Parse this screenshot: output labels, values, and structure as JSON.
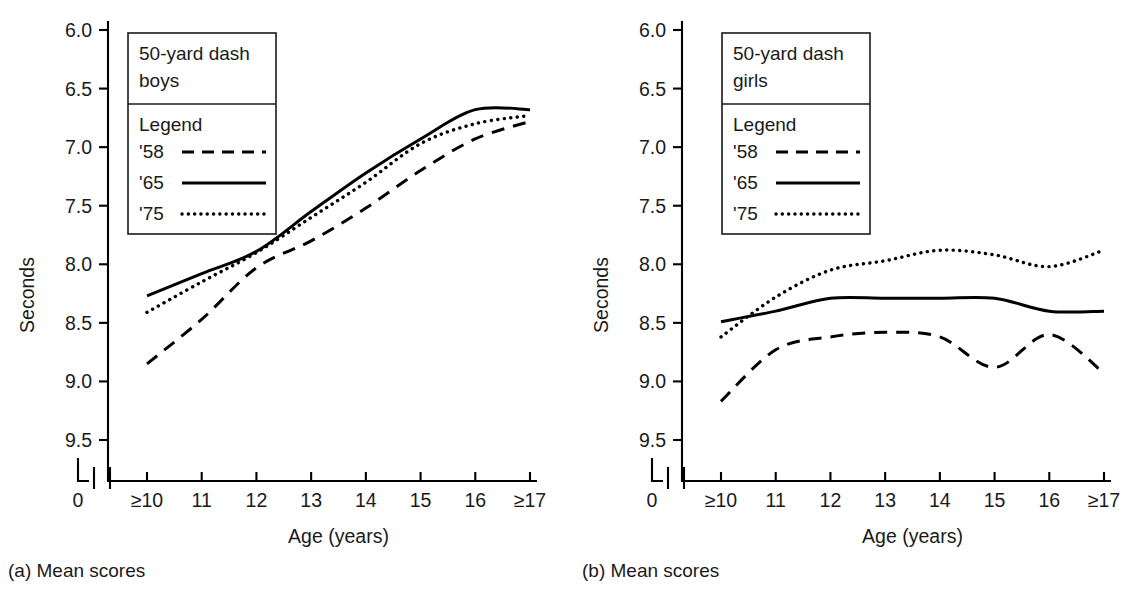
{
  "figure": {
    "panels": [
      {
        "id": "a",
        "caption": "(a) Mean scores",
        "legend": {
          "title_line1": "50-yard dash",
          "title_line2": "boys",
          "heading": "Legend",
          "entries": [
            {
              "label": "'58",
              "style": "dashed"
            },
            {
              "label": "'65",
              "style": "solid"
            },
            {
              "label": "'75",
              "style": "dotted"
            }
          ]
        }
      },
      {
        "id": "b",
        "caption": "(b) Mean scores",
        "legend": {
          "title_line1": "50-yard dash",
          "title_line2": "girls",
          "heading": "Legend",
          "entries": [
            {
              "label": "'58",
              "style": "dashed"
            },
            {
              "label": "'65",
              "style": "solid"
            },
            {
              "label": "'75",
              "style": "dotted"
            }
          ]
        }
      }
    ],
    "origin_label": "0"
  },
  "chart_data": [
    {
      "type": "line",
      "title": "50-yard dash boys",
      "panel": "(a) Mean scores",
      "xlabel": "Age (years)",
      "ylabel": "Seconds",
      "categories": [
        ">=10",
        "11",
        "12",
        "13",
        "14",
        "15",
        "16",
        ">=17"
      ],
      "tick_labels": [
        "≥10",
        "11",
        "12",
        "13",
        "14",
        "15",
        "16",
        "≥17"
      ],
      "ylim": [
        6.0,
        9.5
      ],
      "y_ticks": [
        6.0,
        6.5,
        7.0,
        7.5,
        8.0,
        8.5,
        9.0,
        9.5
      ],
      "y_inverted": true,
      "axis_break": true,
      "grid": false,
      "legend_position": "top-left",
      "series": [
        {
          "name": "'58",
          "style": "dashed",
          "values": [
            8.85,
            8.47,
            8.03,
            7.8,
            7.52,
            7.2,
            6.93,
            6.78
          ]
        },
        {
          "name": "'65",
          "style": "solid",
          "values": [
            8.27,
            8.08,
            7.89,
            7.55,
            7.22,
            6.93,
            6.68,
            6.68
          ]
        },
        {
          "name": "'75",
          "style": "dotted",
          "values": [
            8.41,
            8.15,
            7.9,
            7.6,
            7.3,
            6.97,
            6.8,
            6.73
          ]
        }
      ]
    },
    {
      "type": "line",
      "title": "50-yard dash girls",
      "panel": "(b) Mean scores",
      "xlabel": "Age (years)",
      "ylabel": "Seconds",
      "categories": [
        ">=10",
        "11",
        "12",
        "13",
        "14",
        "15",
        "16",
        ">=17"
      ],
      "tick_labels": [
        "≥10",
        "11",
        "12",
        "13",
        "14",
        "15",
        "16",
        "≥17"
      ],
      "ylim": [
        6.0,
        9.5
      ],
      "y_ticks": [
        6.0,
        6.5,
        7.0,
        7.5,
        8.0,
        8.5,
        9.0,
        9.5
      ],
      "y_inverted": true,
      "axis_break": true,
      "grid": false,
      "legend_position": "top-left",
      "series": [
        {
          "name": "'58",
          "style": "dashed",
          "values": [
            9.17,
            8.73,
            8.62,
            8.58,
            8.62,
            8.88,
            8.6,
            8.93
          ]
        },
        {
          "name": "'65",
          "style": "solid",
          "values": [
            8.49,
            8.4,
            8.29,
            8.29,
            8.29,
            8.29,
            8.4,
            8.4
          ]
        },
        {
          "name": "'75",
          "style": "dotted",
          "values": [
            8.62,
            8.28,
            8.05,
            7.97,
            7.88,
            7.92,
            8.02,
            7.88
          ]
        }
      ]
    }
  ]
}
